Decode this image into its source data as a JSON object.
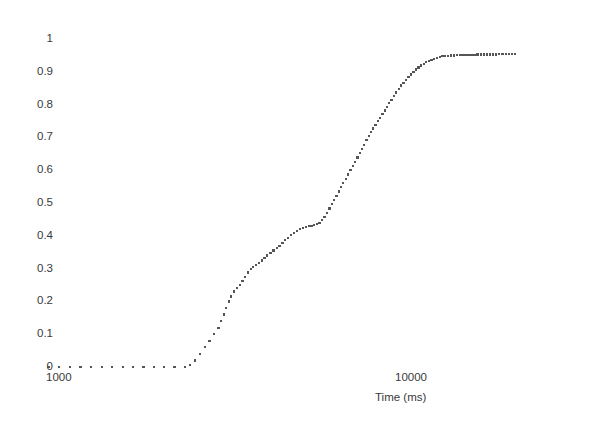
{
  "figure": {
    "background_color": "#ffffff",
    "marker_color": "#555555",
    "text_color": "#3a3a3a"
  },
  "axes": {
    "y_ticks": [
      {
        "label": "1",
        "value": 1.0
      },
      {
        "label": "0.9",
        "value": 0.9
      },
      {
        "label": "0.8",
        "value": 0.8
      },
      {
        "label": "0.7",
        "value": 0.7
      },
      {
        "label": "0.6",
        "value": 0.6
      },
      {
        "label": "0.5",
        "value": 0.5
      },
      {
        "label": "0.4",
        "value": 0.4
      },
      {
        "label": "0.3",
        "value": 0.3
      },
      {
        "label": "0.2",
        "value": 0.2
      },
      {
        "label": "0.1",
        "value": 0.1
      },
      {
        "label": "0",
        "value": 0.0
      }
    ],
    "x_ticks": [
      {
        "label": "1000",
        "value": 1000
      },
      {
        "label": "10000",
        "value": 10000
      }
    ],
    "x_axis_label": "Time (ms)",
    "y_axis_label": ""
  },
  "chart_data": {
    "type": "scatter",
    "title": "",
    "subtitle": "",
    "xlabel": "Time (ms)",
    "ylabel": "",
    "xscale": "log",
    "yscale": "linear",
    "xlim": [
      1000,
      19000
    ],
    "ylim": [
      0,
      1
    ],
    "xticks": [
      1000,
      10000
    ],
    "xticklabels": [
      "1000",
      "10000"
    ],
    "yticks": [
      0,
      0.1,
      0.2,
      0.3,
      0.4,
      0.5,
      0.6,
      0.7,
      0.8,
      0.9,
      1
    ],
    "yticklabels": [
      "0",
      "0.1",
      "0.2",
      "0.3",
      "0.4",
      "0.5",
      "0.6",
      "0.7",
      "0.8",
      "0.9",
      "1"
    ],
    "grid": false,
    "legend": false,
    "legend_position": "none",
    "annotations": [],
    "marker": "dot",
    "marker_size": 2,
    "series": [
      {
        "name": "cumulative fraction",
        "color": "#555555",
        "x": [
          1010,
          1080,
          1155,
          1235,
          1320,
          1410,
          1505,
          1610,
          1720,
          1835,
          1960,
          2090,
          2230,
          2380,
          2460,
          2540,
          2620,
          2700,
          2780,
          2860,
          2940,
          2990,
          3040,
          3090,
          3140,
          3190,
          3240,
          3300,
          3360,
          3420,
          3480,
          3540,
          3600,
          3660,
          3720,
          3790,
          3860,
          3930,
          4000,
          4080,
          4160,
          4240,
          4320,
          4400,
          4480,
          4560,
          4650,
          4740,
          4830,
          4920,
          5010,
          5100,
          5190,
          5280,
          5370,
          5460,
          5550,
          5640,
          5730,
          5820,
          5910,
          6000,
          6090,
          6180,
          6270,
          6360,
          6450,
          6550,
          6650,
          6750,
          6850,
          6950,
          7050,
          7150,
          7250,
          7350,
          7460,
          7570,
          7680,
          7790,
          7900,
          8010,
          8130,
          8250,
          8370,
          8490,
          8610,
          8740,
          8870,
          9000,
          9140,
          9280,
          9420,
          9570,
          9720,
          9870,
          10030,
          10190,
          10350,
          10520,
          10690,
          10870,
          11050,
          11240,
          11430,
          11630,
          11830,
          12040,
          12250,
          12470,
          12700,
          12930,
          13170,
          13410,
          13660,
          13920,
          14180,
          14450,
          14730,
          15010,
          15300,
          15600,
          15910,
          16220,
          16540,
          16870,
          17210,
          17560,
          17910,
          18280,
          18650,
          19000
        ],
        "y": [
          0.0,
          0.0,
          0.0,
          0.0,
          0.0,
          0.0,
          0.0,
          0.0,
          0.0,
          0.0,
          0.0,
          0.0,
          0.0,
          0.0,
          0.005,
          0.02,
          0.04,
          0.06,
          0.08,
          0.1,
          0.12,
          0.14,
          0.16,
          0.18,
          0.2,
          0.215,
          0.23,
          0.24,
          0.25,
          0.262,
          0.275,
          0.288,
          0.298,
          0.305,
          0.312,
          0.318,
          0.325,
          0.332,
          0.34,
          0.348,
          0.355,
          0.362,
          0.37,
          0.378,
          0.386,
          0.394,
          0.402,
          0.409,
          0.415,
          0.42,
          0.424,
          0.427,
          0.429,
          0.431,
          0.433,
          0.436,
          0.44,
          0.448,
          0.458,
          0.47,
          0.483,
          0.496,
          0.509,
          0.522,
          0.535,
          0.548,
          0.561,
          0.574,
          0.587,
          0.6,
          0.613,
          0.626,
          0.639,
          0.652,
          0.665,
          0.678,
          0.691,
          0.704,
          0.716,
          0.727,
          0.738,
          0.749,
          0.76,
          0.771,
          0.782,
          0.793,
          0.804,
          0.815,
          0.826,
          0.837,
          0.848,
          0.858,
          0.867,
          0.876,
          0.884,
          0.892,
          0.9,
          0.907,
          0.913,
          0.919,
          0.924,
          0.929,
          0.933,
          0.937,
          0.94,
          0.943,
          0.945,
          0.947,
          0.948,
          0.949,
          0.95,
          0.95,
          0.951,
          0.951,
          0.951,
          0.952,
          0.952,
          0.952,
          0.952,
          0.953,
          0.953,
          0.953,
          0.953,
          0.953,
          0.953,
          0.953,
          0.954,
          0.954,
          0.954,
          0.954,
          0.954,
          0.954
        ]
      }
    ]
  }
}
